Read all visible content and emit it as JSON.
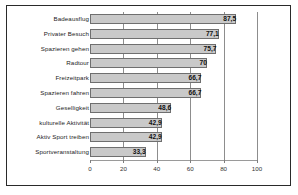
{
  "chart_data": {
    "type": "bar",
    "orientation": "horizontal",
    "title": "",
    "subtitle": "",
    "xlabel": "",
    "ylabel": "",
    "xlim": [
      0,
      100
    ],
    "grid": true,
    "legend": null,
    "decimal_separator": ",",
    "categories": [
      "Badeausflug",
      "Privater Besuch",
      "Spazieren gehen",
      "Radtour",
      "Freizeitpark",
      "Spazieren fahren",
      "Geselligkeit",
      "kulturelle Aktivität",
      "Aktiv Sport treiben",
      "Sportveranstaltung"
    ],
    "values": [
      87.5,
      77.1,
      75.7,
      70,
      66.7,
      66.7,
      48.6,
      42.9,
      42.9,
      33.3
    ],
    "value_labels": [
      "87,5",
      "77,1",
      "75,7",
      "70",
      "66,7",
      "66,7",
      "48,6",
      "42,9",
      "42,9",
      "33,3"
    ],
    "xticks": [
      0,
      20,
      40,
      60,
      80,
      100
    ],
    "xtick_labels": [
      "0",
      "20",
      "40",
      "60",
      "80",
      "100"
    ],
    "colors": {
      "bar_fill": "#c9c9c9",
      "bar_border": "#6f6f6f",
      "gridline": "#8d8d8d",
      "frame": "#2a2a2a",
      "text": "#1c1c1c",
      "background": "#ffffff"
    }
  }
}
